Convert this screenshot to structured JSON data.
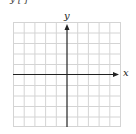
{
  "header": {
    "cropped_text": "y   [    ]"
  },
  "graph": {
    "x_label": "x",
    "y_label": "y",
    "grid": {
      "columns": 10,
      "rows": 10,
      "left": 13,
      "top": 22,
      "right": 120,
      "bottom": 127
    },
    "colors": {
      "grid": "#d4d4d4",
      "axis": "#222222",
      "border": "#cccccc"
    }
  }
}
